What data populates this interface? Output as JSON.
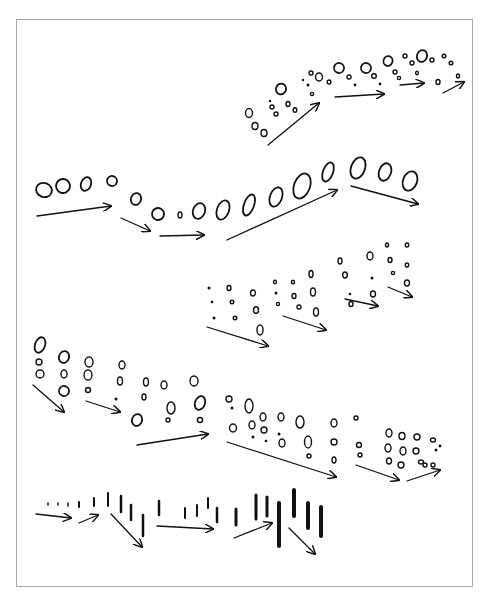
{
  "figure": {
    "frame": {
      "x": 16,
      "y": 19,
      "w": 457,
      "h": 568,
      "border": "#a8a8a8"
    },
    "ink": "#111111",
    "groups": [
      {
        "name": "row-1-small-circles-arc",
        "circles": [
          [
            249,
            113,
            3.5,
            4.5
          ],
          [
            255,
            126,
            3,
            3.5
          ],
          [
            264,
            133,
            3,
            3.5
          ],
          [
            270,
            101,
            1.2,
            1.2
          ],
          [
            272,
            107,
            2,
            2
          ],
          [
            276,
            114,
            2,
            2
          ],
          [
            281,
            89,
            5,
            5.5
          ],
          [
            288,
            104,
            2,
            2.5
          ],
          [
            295,
            110,
            1.8,
            2.3
          ],
          [
            303,
            80,
            1.2,
            1.2
          ],
          [
            308,
            85,
            1.5,
            1.5
          ],
          [
            311,
            73,
            2,
            2
          ],
          [
            319,
            77,
            3.5,
            4
          ],
          [
            312,
            94,
            1.6,
            1.6
          ],
          [
            329,
            82,
            1.8,
            2
          ],
          [
            339,
            68,
            5,
            5
          ],
          [
            349,
            77,
            2,
            2
          ],
          [
            355,
            85,
            1.4,
            1.4
          ],
          [
            366,
            68,
            5,
            5
          ],
          [
            374,
            76,
            2.3,
            2.3
          ],
          [
            380,
            84,
            1.4,
            1.4
          ],
          [
            388,
            61,
            4.5,
            5
          ],
          [
            395,
            72,
            2,
            2
          ],
          [
            399,
            78,
            1.6,
            1.6
          ],
          [
            405,
            56,
            2,
            2
          ],
          [
            412,
            63,
            2,
            2
          ],
          [
            417,
            73,
            1.4,
            1.8
          ],
          [
            422,
            56,
            5,
            6
          ],
          [
            432,
            60,
            2,
            2
          ],
          [
            444,
            56,
            1.8,
            1.8
          ],
          [
            451,
            63,
            1.8,
            1.8
          ],
          [
            438,
            82,
            2,
            2.5
          ],
          [
            458,
            76,
            1.5,
            2
          ]
        ],
        "arrows": [
          [
            268,
            145,
            319,
            103
          ],
          [
            335,
            97,
            384,
            94
          ],
          [
            400,
            85,
            424,
            83
          ],
          [
            443,
            93,
            464,
            82
          ]
        ]
      },
      {
        "name": "row-2-loop-ovals-path",
        "circles": [
          [
            44,
            190,
            8,
            7
          ],
          [
            63,
            186,
            7,
            7
          ],
          [
            86,
            184,
            5,
            7
          ],
          [
            112,
            181,
            5,
            5
          ],
          [
            136,
            199,
            5,
            6
          ],
          [
            158,
            214,
            6,
            6
          ],
          [
            180,
            215,
            2,
            3
          ],
          [
            199,
            211,
            6,
            8
          ],
          [
            223,
            210,
            6,
            10
          ],
          [
            249,
            205,
            5,
            11
          ],
          [
            276,
            197,
            6,
            10
          ],
          [
            302,
            186,
            8,
            13
          ],
          [
            328,
            172,
            5,
            10
          ],
          [
            358,
            168,
            7,
            11
          ],
          [
            385,
            172,
            6,
            9
          ],
          [
            410,
            181,
            7,
            10
          ]
        ],
        "arrows": [
          [
            37,
            216,
            111,
            206
          ],
          [
            121,
            218,
            150,
            231
          ],
          [
            160,
            236,
            204,
            235
          ],
          [
            227,
            240,
            337,
            190
          ],
          [
            351,
            186,
            418,
            204
          ]
        ]
      },
      {
        "name": "row-3-scattered-drops",
        "circles": [
          [
            209,
            288,
            1.5,
            1.5
          ],
          [
            212,
            302,
            1.3,
            1.3
          ],
          [
            214,
            318,
            1.5,
            1.5
          ],
          [
            229,
            288,
            2,
            2.5
          ],
          [
            232,
            302,
            1.8,
            1.8
          ],
          [
            235,
            318,
            1.8,
            1.8
          ],
          [
            253,
            293,
            2.5,
            3
          ],
          [
            256,
            310,
            2.5,
            3.3
          ],
          [
            260,
            330,
            3,
            5
          ],
          [
            275,
            282,
            1.5,
            1.7
          ],
          [
            276,
            293,
            1.5,
            1.5
          ],
          [
            278,
            304,
            1.6,
            1.6
          ],
          [
            293,
            282,
            1.6,
            1.8
          ],
          [
            294,
            296,
            2,
            2.5
          ],
          [
            299,
            307,
            2,
            2
          ],
          [
            311,
            274,
            2,
            3.5
          ],
          [
            313,
            292,
            2.5,
            4
          ],
          [
            316,
            312,
            2.5,
            4
          ],
          [
            340,
            261,
            2,
            3
          ],
          [
            345,
            275,
            2.3,
            3
          ],
          [
            350,
            294,
            1.3,
            1.3
          ],
          [
            351,
            304,
            2,
            2.5
          ],
          [
            370,
            256,
            3,
            4
          ],
          [
            372,
            278,
            1.5,
            1.5
          ],
          [
            373,
            294,
            2.5,
            3
          ],
          [
            387,
            245,
            1.5,
            2
          ],
          [
            390,
            260,
            2,
            2.5
          ],
          [
            393,
            273,
            1.6,
            1.6
          ],
          [
            407,
            245,
            1.7,
            2
          ],
          [
            407,
            265,
            1.7,
            2
          ],
          [
            407,
            283,
            2.5,
            3
          ]
        ],
        "arrows": [
          [
            207,
            327,
            268,
            346
          ],
          [
            283,
            316,
            326,
            330
          ],
          [
            345,
            299,
            378,
            306
          ],
          [
            388,
            287,
            412,
            297
          ]
        ]
      },
      {
        "name": "row-4-splash-curls",
        "circles": [
          [
            40,
            345,
            5,
            8
          ],
          [
            39,
            362,
            3,
            3
          ],
          [
            40,
            374,
            4,
            4
          ],
          [
            64,
            357,
            5,
            6
          ],
          [
            64,
            374,
            3,
            4
          ],
          [
            64,
            391,
            5,
            5
          ],
          [
            89,
            362,
            4,
            5
          ],
          [
            88,
            375,
            4,
            5
          ],
          [
            88,
            390,
            2.5,
            2.5
          ],
          [
            122,
            365,
            3,
            4
          ],
          [
            120,
            381,
            2.5,
            4
          ],
          [
            116,
            399,
            1.5,
            1.5
          ],
          [
            146,
            382,
            2.5,
            4
          ],
          [
            144,
            397,
            2,
            3
          ],
          [
            137,
            420,
            5,
            6
          ],
          [
            164,
            385,
            3,
            4
          ],
          [
            171,
            408,
            4,
            6
          ],
          [
            168,
            420,
            2,
            2
          ],
          [
            194,
            381,
            4,
            5
          ],
          [
            200,
            403,
            5,
            7
          ],
          [
            200,
            420,
            2.5,
            2.5
          ],
          [
            229,
            399,
            3,
            3
          ],
          [
            232,
            408,
            1.5,
            1.5
          ],
          [
            233,
            428,
            3.5,
            4
          ],
          [
            249,
            406,
            4,
            7
          ],
          [
            252,
            425,
            3,
            4
          ],
          [
            253,
            437,
            1.5,
            1.5
          ],
          [
            263,
            417,
            3,
            4
          ],
          [
            264,
            430,
            3,
            3
          ],
          [
            266,
            441,
            1.3,
            1.3
          ],
          [
            281,
            417,
            3,
            4
          ],
          [
            279,
            434,
            1.5,
            1.5
          ],
          [
            282,
            443,
            3,
            4
          ],
          [
            300,
            422,
            4,
            6
          ],
          [
            308,
            442,
            3.5,
            6
          ],
          [
            309,
            456,
            2,
            2
          ],
          [
            334,
            423,
            3,
            4
          ],
          [
            334,
            442,
            3,
            3
          ],
          [
            334,
            460,
            2,
            3
          ],
          [
            356,
            418,
            2,
            2
          ],
          [
            359,
            445,
            2.5,
            2.5
          ],
          [
            360,
            455,
            2,
            2
          ],
          [
            389,
            433,
            3,
            4
          ],
          [
            388,
            448,
            3,
            4
          ],
          [
            389,
            461,
            2.5,
            3
          ],
          [
            402,
            436,
            3,
            3.5
          ],
          [
            403,
            451,
            3,
            4
          ],
          [
            401,
            465,
            3,
            3
          ],
          [
            417,
            437,
            3,
            3
          ],
          [
            416,
            451,
            3,
            3
          ],
          [
            421,
            462,
            2.5,
            2
          ],
          [
            433,
            440,
            2.5,
            2
          ],
          [
            436,
            450,
            1.5,
            1.5
          ],
          [
            440,
            446,
            1.4,
            1.4
          ],
          [
            425,
            465,
            2,
            2
          ],
          [
            433,
            465,
            2,
            2
          ]
        ],
        "arrows": [
          [
            33,
            385,
            64,
            412
          ],
          [
            86,
            401,
            120,
            412
          ],
          [
            137,
            445,
            208,
            434
          ],
          [
            227,
            442,
            336,
            477
          ],
          [
            356,
            465,
            399,
            480
          ],
          [
            407,
            481,
            440,
            470
          ]
        ]
      },
      {
        "name": "row-5-streaks",
        "dashes": [
          [
            48,
            503,
            48,
            505,
            1.5
          ],
          [
            58,
            503,
            58,
            505,
            1.5
          ],
          [
            68,
            503,
            68,
            506,
            1.5
          ],
          [
            79,
            502,
            79,
            507,
            2
          ],
          [
            94,
            498,
            94,
            506,
            2
          ],
          [
            108,
            493,
            108,
            506,
            2
          ],
          [
            121,
            496,
            121,
            512,
            2.5
          ],
          [
            131,
            505,
            131,
            520,
            2.5
          ],
          [
            143,
            515,
            143,
            536,
            2.5
          ],
          [
            159,
            501,
            159,
            515,
            2.5
          ],
          [
            185,
            508,
            185,
            518,
            2
          ],
          [
            197,
            505,
            197,
            516,
            2
          ],
          [
            208,
            498,
            208,
            508,
            2
          ],
          [
            217,
            508,
            217,
            522,
            2.5
          ],
          [
            236,
            509,
            236,
            525,
            3
          ],
          [
            256,
            495,
            256,
            519,
            3
          ],
          [
            267,
            497,
            267,
            516,
            3
          ],
          [
            279,
            503,
            279,
            546,
            4
          ],
          [
            294,
            490,
            294,
            516,
            4
          ],
          [
            308,
            503,
            308,
            528,
            4
          ],
          [
            321,
            507,
            321,
            536,
            4
          ]
        ],
        "arrows": [
          [
            36,
            514,
            71,
            518
          ],
          [
            79,
            523,
            98,
            515
          ],
          [
            111,
            514,
            142,
            547
          ],
          [
            157,
            526,
            213,
            529
          ],
          [
            234,
            538,
            272,
            523
          ],
          [
            289,
            528,
            315,
            554
          ]
        ]
      }
    ]
  }
}
